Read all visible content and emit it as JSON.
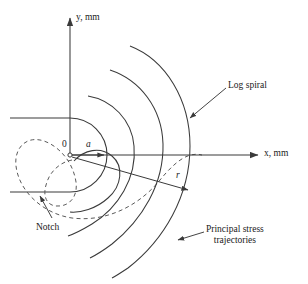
{
  "figure": {
    "type": "engineering-diagram",
    "line_color": "#3a3a3a",
    "text_color": "#1a1a1a",
    "background": "#ffffff"
  },
  "axes": {
    "x_label": "x, mm",
    "y_label": "y, mm",
    "origin_label": "0",
    "origin_x": 70,
    "origin_y": 155,
    "x_axis_end": 262,
    "y_axis_top": 14
  },
  "annotations": {
    "log_spiral": "Log spiral",
    "notch": "Notch",
    "principal_stress_line1": "Principal stress",
    "principal_stress_line2": "trajectories",
    "radius_symbol": "r",
    "notch_radius_symbol": "a"
  },
  "geometry": {
    "notch_top_y": 118,
    "notch_bottom_y": 192,
    "notch_left_x": 10,
    "notch_root_x": 70,
    "dashed_spiral_x_axis_crossing": 202,
    "solid_arc_x_crossings": [
      104,
      130,
      156,
      180,
      202
    ],
    "arc_count": 4
  }
}
